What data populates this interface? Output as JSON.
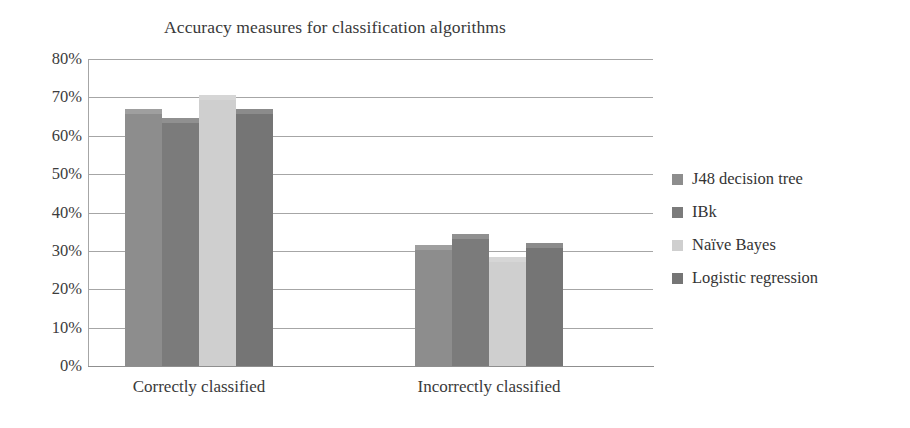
{
  "chart_data": {
    "type": "bar",
    "title": "Accuracy measures for classification algorithms",
    "xlabel": "",
    "ylabel": "",
    "ylim": [
      0,
      80
    ],
    "ytick_labels": [
      "80%",
      "70%",
      "60%",
      "50%",
      "40%",
      "30%",
      "20%",
      "10%",
      "0%"
    ],
    "ytick_values": [
      80,
      70,
      60,
      50,
      40,
      30,
      20,
      10,
      0
    ],
    "grid": true,
    "legend_position": "right",
    "categories": [
      "Correctly classified",
      "Incorrectly classified"
    ],
    "series": [
      {
        "name": "J48 decision tree",
        "color": "#8d8d8d",
        "values": [
          67.0,
          31.5
        ]
      },
      {
        "name": "IBk",
        "color": "#7b7b7b",
        "values": [
          64.5,
          34.5
        ]
      },
      {
        "name": "Naïve Bayes",
        "color": "#cfcfcf",
        "values": [
          70.5,
          28.5
        ]
      },
      {
        "name": "Logistic regression",
        "color": "#757575",
        "values": [
          67.0,
          32.0
        ]
      }
    ]
  },
  "legend": {
    "items": [
      {
        "label": "J48 decision tree"
      },
      {
        "label": "IBk"
      },
      {
        "label": "Naïve Bayes"
      },
      {
        "label": "Logistic regression"
      }
    ]
  },
  "colors": {
    "gridline": "#a6a6a6",
    "axis": "#8f8f8f",
    "text": "#3a3a3a",
    "background": "#ffffff"
  }
}
